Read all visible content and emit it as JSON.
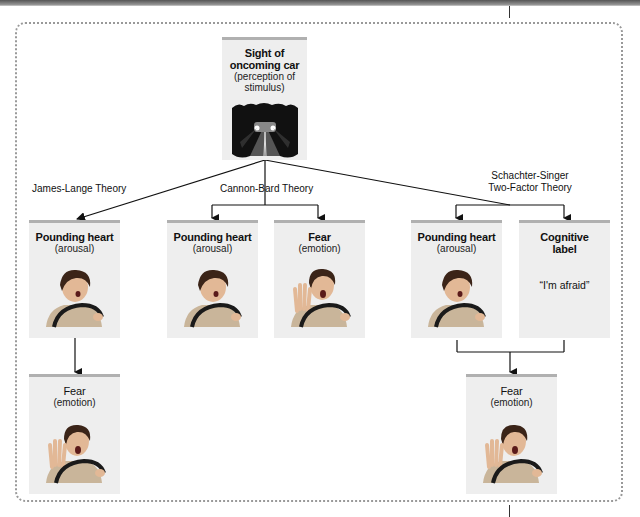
{
  "stimulus": {
    "title": "Sight of oncoming car",
    "subtitle": "(perception of stimulus)",
    "icon": "car-headlights-road-image"
  },
  "theories": [
    {
      "name": "James-Lange Theory"
    },
    {
      "name": "Cannon-Bard Theory"
    },
    {
      "name": "Schachter-Singer",
      "name_line2": "Two-Factor Theory"
    }
  ],
  "cards": {
    "jl_arousal": {
      "title": "Pounding heart",
      "subtitle": "(arousal)",
      "icon": "startled-driver-image"
    },
    "jl_fear": {
      "title": "Fear",
      "subtitle": "(emotion)",
      "icon": "frightened-driver-image"
    },
    "cb_arousal": {
      "title": "Pounding heart",
      "subtitle": "(arousal)",
      "icon": "startled-driver-image"
    },
    "cb_fear": {
      "title": "Fear",
      "subtitle": "(emotion)",
      "icon": "frightened-driver-image"
    },
    "ss_arousal": {
      "title": "Pounding heart",
      "subtitle": "(arousal)",
      "icon": "startled-driver-image"
    },
    "ss_label": {
      "title": "Cognitive",
      "title_line2": "label",
      "quote": "“I'm afraid”"
    },
    "ss_fear": {
      "title": "Fear",
      "subtitle": "(emotion)",
      "icon": "frightened-driver-image"
    }
  },
  "colors": {
    "card_bg": "#eeeeee",
    "card_top": "#b0b0b0",
    "frame": "#999999",
    "line": "#111111"
  }
}
